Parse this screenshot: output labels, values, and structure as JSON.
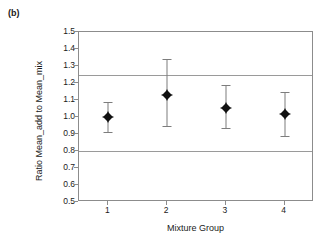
{
  "panel": {
    "label": "(b)"
  },
  "chart_data": {
    "type": "scatter",
    "title": "",
    "subtitle": "",
    "xlabel": "Mixture Group",
    "ylabel": "Ratio Mean_add to Mean_mix",
    "categories": [
      "1",
      "2",
      "3",
      "4"
    ],
    "x": [
      1,
      2,
      3,
      4
    ],
    "values": [
      1.0,
      1.13,
      1.055,
      1.015
    ],
    "error_low": [
      0.91,
      0.945,
      0.935,
      0.89
    ],
    "error_high": [
      1.09,
      1.34,
      1.19,
      1.145
    ],
    "series": [
      {
        "name": "Ratio Mean_add to Mean_mix",
        "values": [
          1.0,
          1.13,
          1.055,
          1.015
        ],
        "error_low": [
          0.91,
          0.945,
          0.935,
          0.89
        ],
        "error_high": [
          1.09,
          1.34,
          1.19,
          1.145
        ]
      }
    ],
    "points": [
      {
        "group": "1",
        "mean": 1.0,
        "lower": 0.91,
        "upper": 1.09
      },
      {
        "group": "2",
        "mean": 1.13,
        "lower": 0.945,
        "upper": 1.34
      },
      {
        "group": "3",
        "mean": 1.055,
        "lower": 0.935,
        "upper": 1.19
      },
      {
        "group": "4",
        "mean": 1.015,
        "lower": 0.89,
        "upper": 1.145
      }
    ],
    "ylim": [
      0.5,
      1.5
    ],
    "ytick_step": 0.1,
    "yticks": [
      "1.5",
      "1.4",
      "1.3",
      "1.2",
      "1.1",
      "1.0",
      "0.9",
      "0.8",
      "0.7",
      "0.6",
      "0.5"
    ],
    "xticks": [
      "1",
      "2",
      "3",
      "4"
    ],
    "xlim": [
      0.5,
      4.5
    ],
    "grid": false,
    "legend": false,
    "legend_position": "none",
    "reference_lines": [
      {
        "value": 1.25,
        "color": "#9a9a9a"
      },
      {
        "value": 0.8,
        "color": "#9a9a9a"
      }
    ],
    "marker_style": "filled-diamond-with-cross",
    "marker_color": "#111111",
    "errorbar_color": "#7d7d7d",
    "frame_color": "#8c8c8c",
    "background": "#ffffff"
  }
}
